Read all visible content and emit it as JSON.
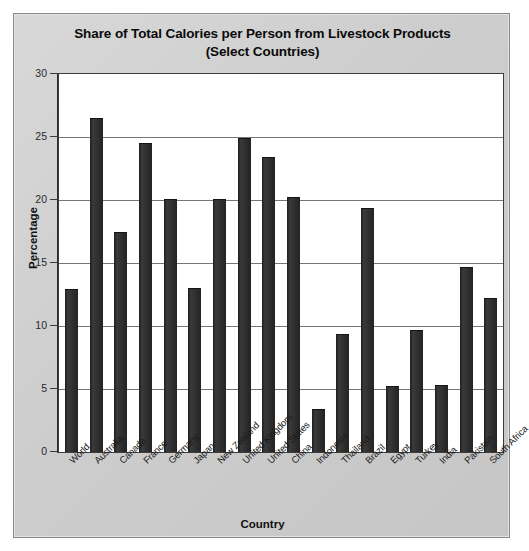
{
  "chart_data": {
    "type": "bar",
    "title": "Share of Total Calories per Person from Livestock Products (Select Countries)",
    "title_line1": "Share of Total Calories per Person from Livestock Products",
    "title_line2": "(Select Countries)",
    "xlabel": "Country",
    "ylabel": "Percentage",
    "ylim": [
      0,
      30
    ],
    "yticks": [
      0,
      5,
      10,
      15,
      20,
      25,
      30
    ],
    "grid": true,
    "legend": false,
    "bar_color": "#2e2e2e",
    "plot_background": "#ffffff",
    "panel_background": "#d0d0d0",
    "categories": [
      "World",
      "Australia",
      "Canada",
      "France",
      "Germany",
      "Japan",
      "New Zealand",
      "United Kingdom",
      "United States",
      "China",
      "Indonesia",
      "Thailand",
      "Brazil",
      "Egypt",
      "Turkey",
      "India",
      "Pakistan",
      "South Africa"
    ],
    "values": [
      12.9,
      26.5,
      17.5,
      24.5,
      20.1,
      13.0,
      20.1,
      24.9,
      23.4,
      20.2,
      3.4,
      9.4,
      19.4,
      5.2,
      9.7,
      5.3,
      14.7,
      12.2
    ]
  }
}
